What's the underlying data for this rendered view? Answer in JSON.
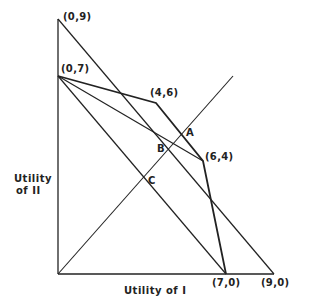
{
  "diagram": {
    "axes": {
      "x_label": "Utility of I",
      "y_label_line1": "Utility",
      "y_label_line2": "of II"
    },
    "points": {
      "p09": "(0,9)",
      "p07": "(0,7)",
      "p46": "(4,6)",
      "p64": "(6,4)",
      "p70": "(7,0)",
      "p90": "(9,0)"
    },
    "intersections": {
      "A": "A",
      "B": "B",
      "C": "C"
    },
    "segments": [
      {
        "from": [
          0,
          9
        ],
        "to": [
          9,
          0
        ],
        "desc": "line (0,9)-(9,0)"
      },
      {
        "from": [
          0,
          7
        ],
        "to": [
          4,
          6
        ],
        "desc": "frontier"
      },
      {
        "from": [
          4,
          6
        ],
        "to": [
          6,
          4
        ],
        "desc": "frontier"
      },
      {
        "from": [
          6,
          4
        ],
        "to": [
          7,
          0
        ],
        "desc": "frontier"
      },
      {
        "from": [
          0,
          7
        ],
        "to": [
          6,
          4
        ],
        "desc": "chord"
      },
      {
        "from": [
          0,
          7
        ],
        "to": [
          7,
          0
        ],
        "desc": "chord"
      },
      {
        "from": [
          0,
          0
        ],
        "to": [
          7.3,
          7
        ],
        "desc": "45-degree line"
      }
    ],
    "line_color": "#222222"
  }
}
